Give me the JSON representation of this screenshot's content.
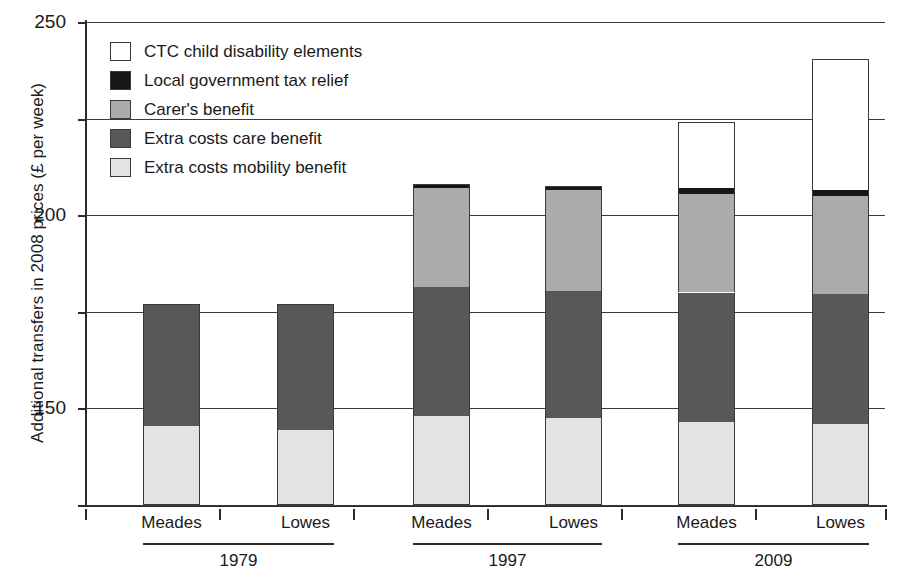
{
  "chart_data": {
    "type": "bar",
    "subtype": "stacked-bar",
    "title": "",
    "xlabel": "",
    "ylabel": "Additional transfers in 2008 prices (£ per week)",
    "ylim": [
      0,
      250
    ],
    "yticks": [
      0,
      50,
      100,
      150,
      200,
      250
    ],
    "grid": true,
    "legend_position": "top-left-inside",
    "categories": [
      "1979 Meades",
      "1979 Lowes",
      "1997 Meades",
      "1997 Lowes",
      "2009 Meades",
      "2009 Lowes"
    ],
    "groups": [
      {
        "year": "1979",
        "families": [
          "Meades",
          "Lowes"
        ]
      },
      {
        "year": "1997",
        "families": [
          "Meades",
          "Lowes"
        ]
      },
      {
        "year": "2009",
        "families": [
          "Meades",
          "Lowes"
        ]
      }
    ],
    "series": [
      {
        "name": "Extra costs mobility benefit",
        "color": "#e3e3e3",
        "values": [
          41,
          39,
          46,
          45,
          43,
          42
        ]
      },
      {
        "name": "Extra costs care benefit",
        "color": "#585858",
        "values": [
          63,
          65,
          67,
          66,
          67,
          67
        ]
      },
      {
        "name": "Carer's benefit",
        "color": "#ababab",
        "values": [
          0,
          0,
          51,
          52,
          51,
          51
        ]
      },
      {
        "name": "Local government tax relief",
        "color": "#17171a",
        "values": [
          0,
          0,
          2,
          2,
          3,
          3
        ]
      },
      {
        "name": "CTC child disability elements",
        "color": "#ffffff",
        "values": [
          0,
          0,
          0,
          0,
          34,
          68
        ]
      }
    ],
    "totals": [
      104,
      104,
      166,
      165,
      198,
      231
    ],
    "legend": [
      {
        "label": "CTC child disability elements",
        "color": "#ffffff"
      },
      {
        "label": "Local government tax relief",
        "color": "#17171a"
      },
      {
        "label": "Carer's benefit",
        "color": "#ababab"
      },
      {
        "label": "Extra costs care benefit",
        "color": "#585858"
      },
      {
        "label": "Extra costs mobility benefit",
        "color": "#e3e3e3"
      }
    ]
  },
  "axis": {
    "ytick_labels": [
      "250",
      "200",
      "150",
      "100",
      "50",
      "0"
    ]
  },
  "xaxis": {
    "groups": [
      {
        "year": "1979",
        "left_label": "Meades",
        "right_label": "Lowes"
      },
      {
        "year": "1997",
        "left_label": "Meades",
        "right_label": "Lowes"
      },
      {
        "year": "2009",
        "left_label": "Meades",
        "right_label": "Lowes"
      }
    ]
  }
}
